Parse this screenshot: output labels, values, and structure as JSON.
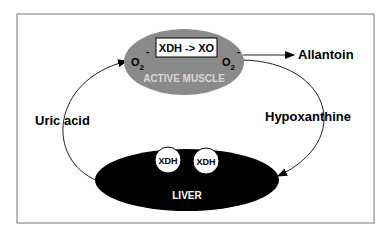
{
  "diagram": {
    "muscle": {
      "label": "ACTIVE MUSCLE",
      "enzyme_box": "XDH -> XO",
      "o2_left": "O",
      "o2_right": "O",
      "sub": "2",
      "sup": "-",
      "fill": "#8a8a8a"
    },
    "liver": {
      "label": "LIVER",
      "enzymes": [
        "XDH",
        "XDH"
      ],
      "fill": "#000000"
    },
    "labels": {
      "allantoin": "Allantoin",
      "hypoxanthine": "Hypoxanthine",
      "uric_acid": "Uric acid"
    }
  }
}
